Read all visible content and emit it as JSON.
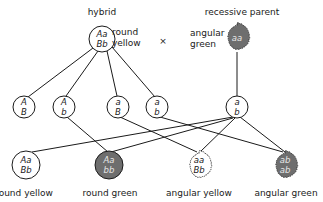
{
  "parents": {
    "hybrid": {
      "title": "hybrid",
      "genotype_line1": "Aa",
      "genotype_line2": "Bb",
      "phenotype_line1": "round",
      "phenotype_line2": "yellow"
    },
    "cross_symbol": "×",
    "recessive": {
      "title": "recessive parent",
      "genotype": "aa",
      "phenotype_line1": "angular",
      "phenotype_line2": "green"
    }
  },
  "gametes": [
    {
      "line1": "A",
      "line2": "B"
    },
    {
      "line1": "A",
      "line2": "b"
    },
    {
      "line1": "a",
      "line2": "B"
    },
    {
      "line1": "a",
      "line2": "b"
    },
    {
      "line1": "a",
      "line2": "b"
    }
  ],
  "offspring": [
    {
      "line1": "Aa",
      "line2": "Bb",
      "label": "round yellow"
    },
    {
      "line1": "Aa",
      "line2": "bb",
      "label": "round green"
    },
    {
      "line1": "aa",
      "line2": "Bb",
      "label": "angular yellow"
    },
    {
      "line1": "ab",
      "line2": "ab",
      "label": "angular green"
    }
  ],
  "colors": {
    "line": "#1a1a1a",
    "recessive_fill": "#6e6e6e",
    "white_fill": "#ffffff"
  }
}
